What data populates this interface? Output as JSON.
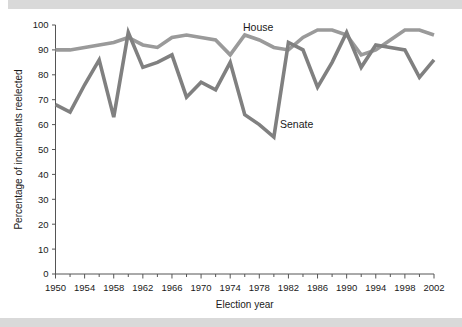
{
  "figure": {
    "background_color": "#ffffff",
    "band_color": "#d9d9d9"
  },
  "chart_data": {
    "type": "line",
    "title": "",
    "xlabel": "Election year",
    "ylabel": "Percentage of incumbents reelected",
    "xlim": [
      1950,
      2002
    ],
    "ylim": [
      0,
      100
    ],
    "ytick_labels": [
      "0",
      "10",
      "20",
      "30",
      "40",
      "50",
      "60",
      "70",
      "80",
      "90",
      "100"
    ],
    "ytick_values": [
      0,
      10,
      20,
      30,
      40,
      50,
      60,
      70,
      80,
      90,
      100
    ],
    "xtick_labels": [
      "1950",
      "1954",
      "1958",
      "1962",
      "1966",
      "1970",
      "1974",
      "1978",
      "1982",
      "1986",
      "1990",
      "1994",
      "1998",
      "2002"
    ],
    "xtick_values": [
      1950,
      1954,
      1958,
      1962,
      1966,
      1970,
      1974,
      1978,
      1982,
      1986,
      1990,
      1994,
      1998,
      2002
    ],
    "x": [
      1950,
      1952,
      1954,
      1956,
      1958,
      1960,
      1962,
      1964,
      1966,
      1968,
      1970,
      1972,
      1974,
      1976,
      1978,
      1980,
      1982,
      1984,
      1986,
      1988,
      1990,
      1992,
      1994,
      1996,
      1998,
      2000,
      2002
    ],
    "grid": false,
    "legend_position": "inline-annotations",
    "series": [
      {
        "name": "House",
        "color": "#9a9a9a",
        "values": [
          90,
          90,
          91,
          92,
          93,
          95,
          92,
          91,
          95,
          96,
          95,
          94,
          88,
          96,
          94,
          91,
          90,
          95,
          98,
          98,
          96,
          88,
          90,
          94,
          98,
          98,
          96
        ]
      },
      {
        "name": "Senate",
        "color": "#808080",
        "values": [
          68,
          65,
          76,
          86,
          63,
          97,
          83,
          85,
          88,
          71,
          77,
          74,
          85,
          64,
          60,
          55,
          93,
          90,
          75,
          85,
          97,
          83,
          92,
          91,
          90,
          79,
          86
        ]
      }
    ],
    "annotations": [
      {
        "text": "House",
        "x_px": 243,
        "y_px": 31
      },
      {
        "text": "Senate",
        "x_px": 280,
        "y_px": 128
      }
    ]
  }
}
